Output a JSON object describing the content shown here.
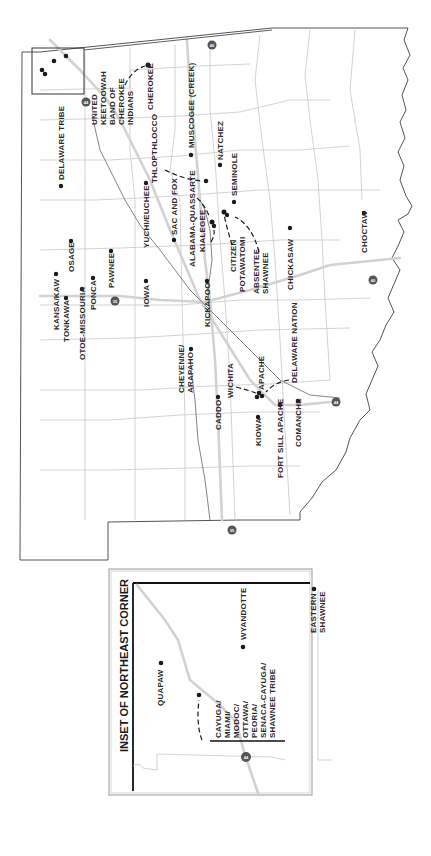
{
  "map": {
    "orientation": "rotated 90° clockwise (north to the left)",
    "tribes": [
      {
        "name": "Delaware Tribe"
      },
      {
        "name": "United Keetoowah Band of Cherokee Indians",
        "lines": [
          "UNITED",
          "KEETOOWAH",
          "BAND OF",
          "CHEROKEE",
          "INDIANS"
        ]
      },
      {
        "name": "Cherokee"
      },
      {
        "name": "Muscogee (Creek)"
      },
      {
        "name": "Thlopthlocco"
      },
      {
        "name": "Natchez"
      },
      {
        "name": "Seminole"
      },
      {
        "name": "Yuchi/Euchee"
      },
      {
        "name": "Sac and Fox"
      },
      {
        "name": "Alabama-Quassarte"
      },
      {
        "name": "Kialegee"
      },
      {
        "name": "Citizen Potawatomi",
        "lines": [
          "CITIZEN",
          "POTAWATOMI"
        ]
      },
      {
        "name": "Absentee Shawnee",
        "lines": [
          "ABSENTEE",
          "SHAWNEE"
        ]
      },
      {
        "name": "Chickasaw"
      },
      {
        "name": "Choctaw"
      },
      {
        "name": "Kansa/Kaw"
      },
      {
        "name": "Osage"
      },
      {
        "name": "Tonkawa"
      },
      {
        "name": "Otoe-Missouria"
      },
      {
        "name": "Ponca"
      },
      {
        "name": "Pawnee"
      },
      {
        "name": "Iowa"
      },
      {
        "name": "Kickapoo"
      },
      {
        "name": "Cheyenne/Arapaho",
        "lines": [
          "CHEYENNE/",
          "ARAPAHO"
        ]
      },
      {
        "name": "Wichita"
      },
      {
        "name": "Apache"
      },
      {
        "name": "Delaware Nation"
      },
      {
        "name": "Caddo"
      },
      {
        "name": "Kiowa"
      },
      {
        "name": "Fort Sill Apache"
      },
      {
        "name": "Comanche"
      }
    ],
    "labels": {
      "delaware_tribe": "DELAWARE TRIBE",
      "ukb_1": "UNITED",
      "ukb_2": "KEETOOWAH",
      "ukb_3": "BAND OF",
      "ukb_4": "CHEROKEE",
      "ukb_5": "INDIANS",
      "cherokee": "CHEROKEE",
      "muscogee": "MUSCOGEE (CREEK)",
      "thlopthlocco": "THLOPTHLOCCO",
      "natchez": "NATCHEZ",
      "seminole": "SEMINOLE",
      "yuchi": "YUCHI/EUCHEE",
      "sac_fox": "SAC AND FOX",
      "alabama": "ALABAMA-QUASSARTE",
      "kialegee": "KIALEGEE",
      "citizen_1": "CITIZEN",
      "citizen_2": "POTAWATOMI",
      "absentee_1": "ABSENTEE",
      "absentee_2": "SHAWNEE",
      "chickasaw": "CHICKASAW",
      "choctaw": "CHOCTAW",
      "kansa": "KANSA/KAW",
      "osage": "OSAGE",
      "tonkawa": "TONKAWA",
      "otoe": "OTOE-MISSOURIA",
      "ponca": "PONCA",
      "pawnee": "PAWNEE",
      "iowa": "IOWA",
      "kickapoo": "KICKAPOO",
      "cheyenne_1": "CHEYENNE/",
      "cheyenne_2": "ARAPAHO",
      "wichita": "WICHITA",
      "apache": "APACHE",
      "delaware_nation": "DELAWARE NATION",
      "caddo": "CADDO",
      "kiowa": "KIOWA",
      "fort_sill": "FORT SILL APACHE",
      "comanche": "COMANCHE"
    },
    "highways": [
      "44",
      "40",
      "35"
    ]
  },
  "inset": {
    "title": "INSET OF NORTHEAST CORNER",
    "labels": {
      "quapaw": "QUAPAW",
      "wyandotte": "WYANDOTTE",
      "eastern_shawnee_1": "EASTERN",
      "eastern_shawnee_2": "SHAWNEE",
      "group_1": "CAYUGA/",
      "group_2": "MIAMI/",
      "group_3": "MODOC/",
      "group_4": "OTTAWA/",
      "group_5": "PEORIA/",
      "group_6": "SENACA-CAYUGA/",
      "group_7": "SHAWNEE TRIBE"
    },
    "highway": "44"
  }
}
